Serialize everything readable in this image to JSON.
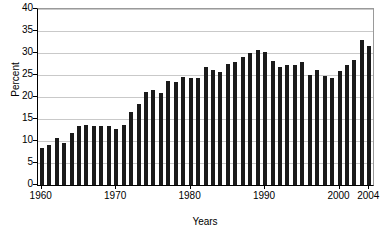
{
  "chart_data": {
    "type": "bar",
    "title": "",
    "xlabel": "Years",
    "ylabel": "Percent",
    "ylim": [
      0,
      40
    ],
    "ytick_labels": [
      "0",
      "5",
      "10",
      "15",
      "20",
      "25",
      "30",
      "35",
      "40"
    ],
    "ytick_values": [
      0,
      5,
      10,
      15,
      20,
      25,
      30,
      35,
      40
    ],
    "xtick_labels": [
      "1960",
      "1970",
      "1980",
      "1990",
      "2000",
      "2004"
    ],
    "xtick_values": [
      1960,
      1970,
      1980,
      1990,
      2000,
      2004
    ],
    "xlim": [
      1959.5,
      2004.5
    ],
    "grid": "horizontal",
    "legend": "none",
    "bar_color": "#1a1a1a",
    "categories": [
      "1960",
      "1961",
      "1962",
      "1963",
      "1964",
      "1965",
      "1966",
      "1967",
      "1968",
      "1969",
      "1970",
      "1971",
      "1972",
      "1973",
      "1974",
      "1975",
      "1976",
      "1977",
      "1978",
      "1979",
      "1980",
      "1981",
      "1982",
      "1983",
      "1984",
      "1985",
      "1986",
      "1987",
      "1988",
      "1989",
      "1990",
      "1991",
      "1992",
      "1993",
      "1994",
      "1995",
      "1996",
      "1997",
      "1998",
      "1999",
      "2000",
      "2001",
      "2002",
      "2003",
      "2004"
    ],
    "values": [
      8.3,
      9.0,
      10.6,
      9.6,
      11.8,
      13.5,
      13.6,
      13.3,
      13.3,
      13.3,
      12.8,
      13.7,
      16.5,
      18.5,
      21.2,
      21.6,
      20.9,
      23.6,
      23.3,
      24.5,
      24.3,
      24.3,
      26.8,
      26.1,
      25.7,
      27.4,
      28.0,
      29.1,
      30.0,
      30.6,
      30.3,
      28.1,
      26.9,
      27.2,
      27.2,
      27.9,
      24.9,
      26.2,
      24.7,
      24.4,
      25.9,
      27.2,
      28.4,
      33.0,
      31.5
    ]
  }
}
